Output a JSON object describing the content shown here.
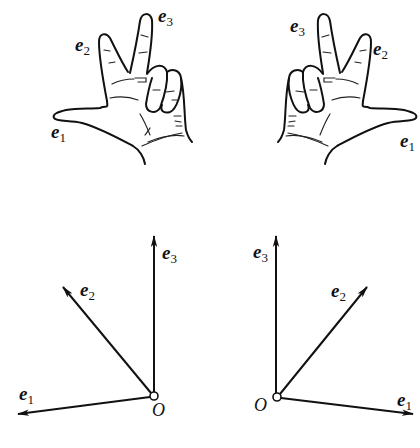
{
  "figure": {
    "panels": [
      {
        "id": "left-hand-gesture",
        "labels": {
          "e1": {
            "base": "e",
            "sub": "1"
          },
          "e2": {
            "base": "e",
            "sub": "2"
          },
          "e3": {
            "base": "e",
            "sub": "3"
          }
        }
      },
      {
        "id": "right-hand-gesture",
        "labels": {
          "e1": {
            "base": "e",
            "sub": "1"
          },
          "e2": {
            "base": "e",
            "sub": "2"
          },
          "e3": {
            "base": "e",
            "sub": "3"
          }
        }
      },
      {
        "id": "left-frame",
        "origin_label": "O",
        "labels": {
          "e1": {
            "base": "e",
            "sub": "1"
          },
          "e2": {
            "base": "e",
            "sub": "2"
          },
          "e3": {
            "base": "e",
            "sub": "3"
          }
        }
      },
      {
        "id": "right-frame",
        "origin_label": "O",
        "labels": {
          "e1": {
            "base": "e",
            "sub": "1"
          },
          "e2": {
            "base": "e",
            "sub": "2"
          },
          "e3": {
            "base": "e",
            "sub": "3"
          }
        }
      }
    ]
  }
}
